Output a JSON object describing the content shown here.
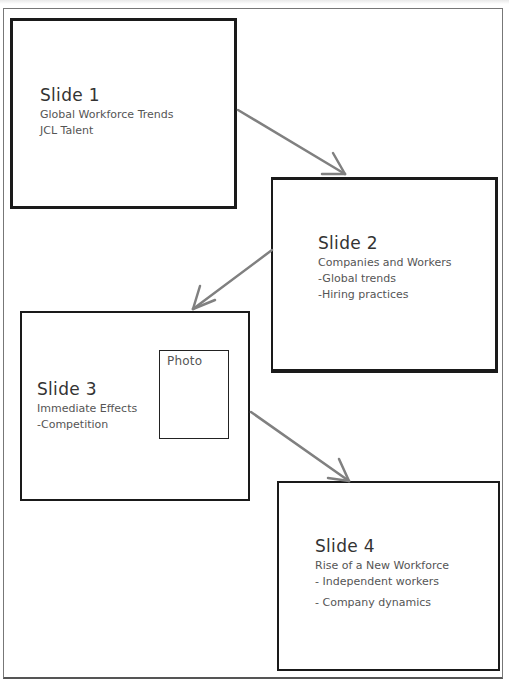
{
  "diagram": {
    "type": "storyboard-flow",
    "slides": [
      {
        "title": "Slide 1",
        "lines": [
          "Global Workforce Trends",
          "JCL Talent"
        ]
      },
      {
        "title": "Slide 2",
        "lines": [
          "Companies and Workers",
          "-Global trends",
          "-Hiring practices"
        ]
      },
      {
        "title": "Slide 3",
        "lines": [
          "Immediate Effects",
          "-Competition"
        ],
        "placeholder": "Photo"
      },
      {
        "title": "Slide 4",
        "lines": [
          "Rise of a New Workforce",
          "- Independent workers",
          "- Company dynamics"
        ]
      }
    ],
    "connections": [
      {
        "from": "Slide 1",
        "to": "Slide 2"
      },
      {
        "from": "Slide 2",
        "to": "Slide 3"
      },
      {
        "from": "Slide 3",
        "to": "Slide 4"
      }
    ],
    "colors": {
      "box_border": "#1a1a1a",
      "arrow": "#808080",
      "text": "#555555",
      "background": "#ffffff"
    }
  }
}
